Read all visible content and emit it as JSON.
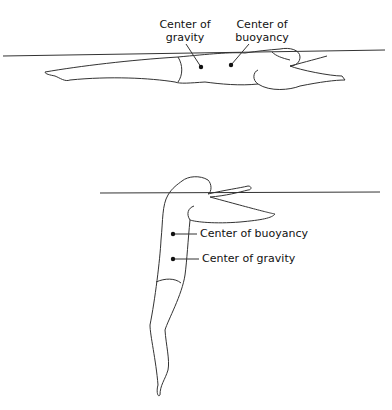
{
  "figure_top": {
    "description": "Swimmer floating horizontally at water surface",
    "labels": {
      "center_of_gravity": [
        "Center of",
        "gravity"
      ],
      "center_of_buoyancy": [
        "Center of",
        "buoyancy"
      ]
    }
  },
  "figure_bottom": {
    "description": "Swimmer floating vertically with legs sinking",
    "labels": {
      "center_of_buoyancy": "Center of buoyancy",
      "center_of_gravity": "Center of gravity"
    }
  },
  "colors": {
    "line": "#333333",
    "text": "#111111",
    "background": "#ffffff"
  }
}
